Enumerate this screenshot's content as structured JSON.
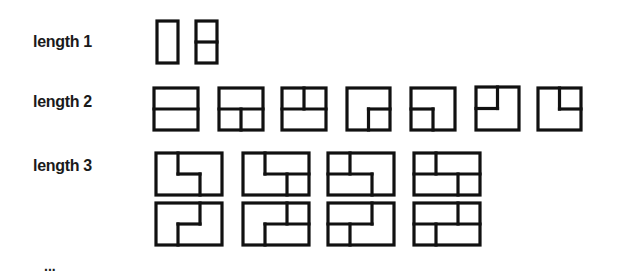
{
  "rows": [
    {
      "label": "length 1",
      "tiling_count": 2,
      "grid": {
        "cols": 1,
        "rows": 2
      },
      "tilings": [
        {
          "id": "L1-1",
          "x": 157,
          "y": 21,
          "w": 21,
          "h": 42,
          "segments": []
        },
        {
          "id": "L1-2",
          "x": 196,
          "y": 21,
          "w": 21,
          "h": 42,
          "segments": [
            [
              0,
              0.5,
              1,
              0.5
            ]
          ]
        }
      ]
    },
    {
      "label": "length 2",
      "tiling_count": 7,
      "grid": {
        "cols": 2,
        "rows": 2
      },
      "tilings": [
        {
          "id": "L2-1",
          "x": 154,
          "y": 88,
          "w": 44,
          "h": 42,
          "segments": [
            [
              0,
              0.5,
              1,
              0.5
            ]
          ]
        },
        {
          "id": "L2-2",
          "x": 219,
          "y": 88,
          "w": 44,
          "h": 42,
          "segments": [
            [
              0,
              0.5,
              1,
              0.5
            ],
            [
              0.5,
              0.5,
              0.5,
              1
            ]
          ]
        },
        {
          "id": "L2-3",
          "x": 282,
          "y": 88,
          "w": 44,
          "h": 42,
          "segments": [
            [
              0,
              0.5,
              1,
              0.5
            ],
            [
              0.5,
              0,
              0.5,
              0.5
            ]
          ]
        },
        {
          "id": "L2-4",
          "x": 347,
          "y": 88,
          "w": 43,
          "h": 42,
          "segments": [
            [
              0.5,
              0.5,
              1,
              0.5
            ],
            [
              0.5,
              0.5,
              0.5,
              1
            ]
          ]
        },
        {
          "id": "L2-5",
          "x": 411,
          "y": 88,
          "w": 44,
          "h": 42,
          "segments": [
            [
              0,
              0.5,
              0.5,
              0.5
            ],
            [
              0.5,
              0.5,
              0.5,
              1
            ]
          ]
        },
        {
          "id": "L2-6",
          "x": 476,
          "y": 87,
          "w": 43,
          "h": 43,
          "segments": [
            [
              0,
              0.5,
              0.5,
              0.5
            ],
            [
              0.5,
              0,
              0.5,
              0.5
            ]
          ]
        },
        {
          "id": "L2-7",
          "x": 538,
          "y": 88,
          "w": 43,
          "h": 42,
          "segments": [
            [
              0.5,
              0.5,
              1,
              0.5
            ],
            [
              0.5,
              0,
              0.5,
              0.5
            ]
          ]
        }
      ]
    },
    {
      "label": "length 3",
      "tiling_count": 8,
      "grid": {
        "cols": 3,
        "rows": 2
      },
      "tilings": [
        {
          "id": "L3-1",
          "x": 156,
          "y": 153,
          "w": 66,
          "h": 42,
          "segments": [
            [
              0.3333,
              0,
              0.3333,
              0.5
            ],
            [
              0.3333,
              0.5,
              0.6667,
              0.5
            ],
            [
              0.6667,
              0.5,
              0.6667,
              1
            ]
          ]
        },
        {
          "id": "L3-2",
          "x": 243,
          "y": 153,
          "w": 66,
          "h": 42,
          "segments": [
            [
              0.3333,
              0,
              0.3333,
              0.5
            ],
            [
              0.3333,
              0.5,
              1,
              0.5
            ],
            [
              0.6667,
              0.5,
              0.6667,
              1
            ]
          ]
        },
        {
          "id": "L3-3",
          "x": 328,
          "y": 153,
          "w": 66,
          "h": 42,
          "segments": [
            [
              0.3333,
              0,
              0.3333,
              0.5
            ],
            [
              0,
              0.5,
              0.6667,
              0.5
            ],
            [
              0.6667,
              0.5,
              0.6667,
              1
            ]
          ]
        },
        {
          "id": "L3-4",
          "x": 414,
          "y": 153,
          "w": 66,
          "h": 42,
          "segments": [
            [
              0.3333,
              0,
              0.3333,
              0.5
            ],
            [
              0,
              0.5,
              1,
              0.5
            ],
            [
              0.6667,
              0.5,
              0.6667,
              1
            ]
          ]
        },
        {
          "id": "L3-5",
          "x": 156,
          "y": 203,
          "w": 66,
          "h": 42,
          "segments": [
            [
              0.6667,
              0,
              0.6667,
              0.5
            ],
            [
              0.3333,
              0.5,
              0.6667,
              0.5
            ],
            [
              0.3333,
              0.5,
              0.3333,
              1
            ]
          ]
        },
        {
          "id": "L3-6",
          "x": 243,
          "y": 203,
          "w": 66,
          "h": 42,
          "segments": [
            [
              0.6667,
              0,
              0.6667,
              0.5
            ],
            [
              0.3333,
              0.5,
              1,
              0.5
            ],
            [
              0.3333,
              0.5,
              0.3333,
              1
            ]
          ]
        },
        {
          "id": "L3-7",
          "x": 328,
          "y": 203,
          "w": 66,
          "h": 42,
          "segments": [
            [
              0.6667,
              0,
              0.6667,
              0.5
            ],
            [
              0,
              0.5,
              0.6667,
              0.5
            ],
            [
              0.3333,
              0.5,
              0.3333,
              1
            ]
          ]
        },
        {
          "id": "L3-8",
          "x": 414,
          "y": 203,
          "w": 66,
          "h": 42,
          "segments": [
            [
              0.6667,
              0,
              0.6667,
              0.5
            ],
            [
              0,
              0.5,
              1,
              0.5
            ],
            [
              0.3333,
              0.5,
              0.3333,
              1
            ]
          ]
        }
      ]
    }
  ],
  "continuation": "..."
}
